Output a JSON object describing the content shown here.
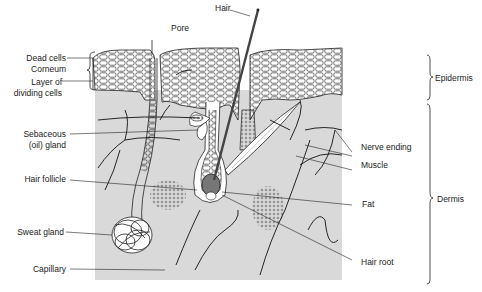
{
  "diagram": {
    "labels": {
      "pore": "Pore",
      "hair": "Hair",
      "dead_cells": "Dead cells",
      "corneum": "Corneum",
      "layer_of": "Layer of",
      "dividing_cells": "dividing cells",
      "sebaceous": "Sebaceous",
      "oil_gland": "(oil) gland",
      "hair_follicle": "Hair follicle",
      "sweat_gland": "Sweat gland",
      "capillary": "Capillary",
      "nerve_ending": "Nerve ending",
      "muscle": "Muscle",
      "fat": "Fat",
      "hair_root": "Hair root",
      "epidermis": "Epidermis",
      "dermis": "Dermis"
    },
    "colors": {
      "dermis_fill": "#d9d9d9",
      "epidermis_fill": "#ffffff",
      "line": "#222222",
      "background": "#ffffff"
    }
  }
}
